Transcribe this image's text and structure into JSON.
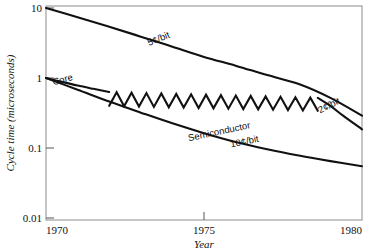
{
  "chart_data": {
    "type": "line",
    "title": "",
    "xlabel": "Year",
    "ylabel": "Cycle time (microseconds)",
    "xlim": [
      1970,
      1980
    ],
    "ylim": [
      0.01,
      10
    ],
    "yscale": "log",
    "grid": false,
    "legend": "inline-annotations",
    "x_ticks": [
      "1970",
      "1975",
      "1980"
    ],
    "x_tick_values": [
      1970,
      1975,
      1980
    ],
    "y_ticks": [
      "10",
      "1",
      "0.1",
      "0.01"
    ],
    "y_tick_values": [
      10,
      1,
      0.1,
      0.01
    ],
    "series": [
      {
        "name": "Core 5¢/bit",
        "label": "5¢/bit",
        "points": [
          {
            "x": 1970,
            "y": 10.0
          },
          {
            "x": 1971,
            "y": 7.4
          },
          {
            "x": 1972,
            "y": 5.4
          },
          {
            "x": 1973,
            "y": 3.9
          },
          {
            "x": 1974,
            "y": 2.8
          },
          {
            "x": 1975,
            "y": 2.0
          },
          {
            "x": 1976,
            "y": 1.5
          },
          {
            "x": 1977,
            "y": 1.1
          },
          {
            "x": 1978,
            "y": 0.82
          },
          {
            "x": 1979,
            "y": 0.52
          },
          {
            "x": 1980,
            "y": 0.29
          }
        ]
      },
      {
        "name": "Core",
        "label": "Core",
        "points": [
          {
            "x": 1970,
            "y": 1.0
          },
          {
            "x": 1970.5,
            "y": 0.88
          },
          {
            "x": 1971,
            "y": 0.78
          },
          {
            "x": 1971.5,
            "y": 0.7
          },
          {
            "x": 1972,
            "y": 0.63
          }
        ]
      },
      {
        "name": "Core oscillation",
        "label": "",
        "note": "sawtooth oscillation band between 1972 and 1978.6",
        "peak_envelope": [
          {
            "x": 1972.0,
            "y": 0.63
          },
          {
            "x": 1978.6,
            "y": 0.52
          }
        ],
        "trough_envelope": [
          {
            "x": 1972.0,
            "y": 0.4
          },
          {
            "x": 1978.6,
            "y": 0.34
          }
        ],
        "teeth": 14
      },
      {
        "name": "Core 2¢/bit",
        "label": "2¢/bit",
        "points": [
          {
            "x": 1978.6,
            "y": 0.52
          },
          {
            "x": 1979,
            "y": 0.4
          },
          {
            "x": 1979.4,
            "y": 0.29
          },
          {
            "x": 1980,
            "y": 0.185
          }
        ]
      },
      {
        "name": "Semiconductor 10¢/bit",
        "label": "Semiconductor",
        "sublabel": "10¢/bit",
        "points": [
          {
            "x": 1970,
            "y": 1.0
          },
          {
            "x": 1971,
            "y": 0.68
          },
          {
            "x": 1972,
            "y": 0.46
          },
          {
            "x": 1973,
            "y": 0.32
          },
          {
            "x": 1974,
            "y": 0.225
          },
          {
            "x": 1975,
            "y": 0.163
          },
          {
            "x": 1976,
            "y": 0.122
          },
          {
            "x": 1977,
            "y": 0.096
          },
          {
            "x": 1978,
            "y": 0.078
          },
          {
            "x": 1979,
            "y": 0.065
          },
          {
            "x": 1980,
            "y": 0.055
          }
        ]
      }
    ],
    "annotations": [
      {
        "id": "cost-5c",
        "text": "5¢/bit",
        "x": 1973.6,
        "y": 3.3,
        "rotation": -22
      },
      {
        "id": "core",
        "text": "Core",
        "x": 1970.55,
        "y": 0.86,
        "rotation": -15
      },
      {
        "id": "cost-2c",
        "text": "2¢/bit",
        "x": 1979.0,
        "y": 0.37,
        "rotation": -27
      },
      {
        "id": "semiconductor",
        "text": "Semiconductor",
        "x": 1975.5,
        "y": 0.155,
        "rotation": -12
      },
      {
        "id": "cost-10c",
        "text": "10¢/bit",
        "x": 1976.3,
        "y": 0.112,
        "rotation": -12
      }
    ],
    "colors": {
      "curve": "#111111",
      "frame": "#8c8c8c",
      "text": "#111111",
      "background": "#ffffff"
    }
  }
}
